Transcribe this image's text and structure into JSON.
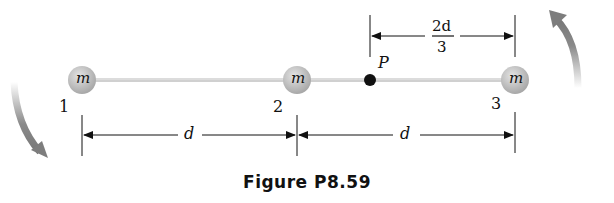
{
  "figure": {
    "caption": "Figure P8.59",
    "masses": [
      {
        "label": "m",
        "index": "1"
      },
      {
        "label": "m",
        "index": "2"
      },
      {
        "label": "m",
        "index": "3"
      }
    ],
    "point": {
      "label": "P"
    },
    "dimensions": {
      "d1": "d",
      "d2": "d",
      "top_numerator": "2d",
      "top_denominator": "3"
    },
    "colors": {
      "rod": "#c8c8c8",
      "mass": "#b8b8b8",
      "arrow": "#8a8a8a",
      "point": "#111111"
    }
  }
}
